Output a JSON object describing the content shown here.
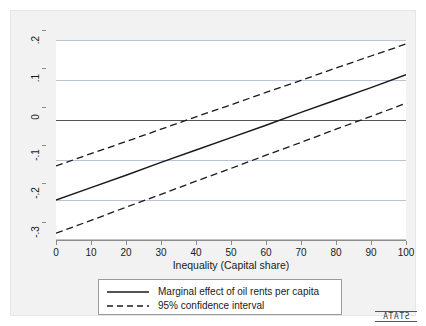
{
  "chart_data": {
    "type": "line",
    "title": "",
    "subtitle": "",
    "xlabel": "Inequality (Capital share)",
    "ylabel": "",
    "xlim": [
      0,
      100
    ],
    "ylim": [
      -0.3,
      0.2
    ],
    "xticks": [
      0,
      10,
      20,
      30,
      40,
      50,
      60,
      70,
      80,
      90,
      100
    ],
    "xtick_labels": [
      "0",
      "10",
      "20",
      "30",
      "40",
      "50",
      "60",
      "70",
      "80",
      "90",
      "100"
    ],
    "yticks": [
      0.2,
      0.1,
      0,
      -0.1,
      -0.2,
      -0.3
    ],
    "ytick_labels": [
      ".2",
      ".1",
      "0",
      "-.1",
      "-.2",
      "-.3"
    ],
    "grid": "horizontal",
    "legend_position": "below-plot",
    "zero_reference_line": 0,
    "series": [
      {
        "name": "Marginal effect of oil rents per capita",
        "style": "solid",
        "color": "#1a1a1a",
        "x": [
          0,
          10,
          20,
          30,
          40,
          50,
          60,
          70,
          80,
          90,
          100
        ],
        "values": [
          -0.2,
          -0.169,
          -0.138,
          -0.106,
          -0.075,
          -0.044,
          -0.013,
          0.019,
          0.05,
          0.081,
          0.113
        ]
      },
      {
        "name": "95% confidence interval upper",
        "style": "dashed",
        "color": "#1a1a1a",
        "x": [
          0,
          10,
          20,
          30,
          40,
          50,
          60,
          70,
          80,
          90,
          100
        ],
        "values": [
          -0.115,
          -0.084,
          -0.054,
          -0.023,
          0.008,
          0.038,
          0.069,
          0.099,
          0.13,
          0.16,
          0.19
        ]
      },
      {
        "name": "95% confidence interval lower",
        "style": "dashed",
        "color": "#1a1a1a",
        "x": [
          0,
          10,
          20,
          30,
          40,
          50,
          60,
          70,
          80,
          90,
          100
        ],
        "values": [
          -0.283,
          -0.251,
          -0.218,
          -0.186,
          -0.153,
          -0.121,
          -0.088,
          -0.056,
          -0.023,
          0.009,
          0.042
        ]
      }
    ],
    "annotations": {
      "solid_zero_crossing_x": 57,
      "ci_upper_zero_crossing_x": 48,
      "ci_lower_zero_crossing_x": 73
    }
  },
  "legend": {
    "entries": [
      {
        "label": "Marginal effect of oil rents per capita",
        "style": "solid"
      },
      {
        "label": "95% confidence interval",
        "style": "dashed"
      }
    ]
  },
  "watermark": {
    "label": "STATA"
  },
  "colors": {
    "line": "#1a1a1a",
    "grid": "#b8c4d0",
    "zero_line": "#555555",
    "axis": "#8c8c8c",
    "plot_background": "#ffffff",
    "graph_background": "#f2f2f2"
  }
}
